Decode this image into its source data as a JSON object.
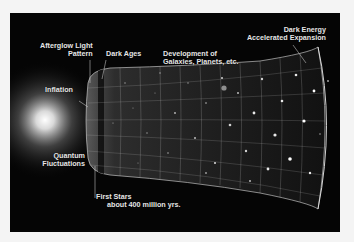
{
  "diagram": {
    "background_color": "#050505",
    "frame_color": "#f4f4f4",
    "labels": [
      {
        "id": "afterglow",
        "lines": [
          "Afterglow Light",
          "Pattern"
        ]
      },
      {
        "id": "dark-ages",
        "lines": [
          "Dark Ages"
        ]
      },
      {
        "id": "development",
        "lines": [
          "Development of",
          "Galaxies, Planets, etc."
        ]
      },
      {
        "id": "dark-energy",
        "lines": [
          "Dark Energy",
          "Accelerated Expansion"
        ]
      },
      {
        "id": "inflation",
        "lines": [
          "Inflation"
        ]
      },
      {
        "id": "quantum",
        "lines": [
          "Quantum",
          "Fluctuations"
        ]
      },
      {
        "id": "first-stars",
        "lines": [
          "First Stars",
          "about 400 million yrs."
        ]
      }
    ]
  }
}
